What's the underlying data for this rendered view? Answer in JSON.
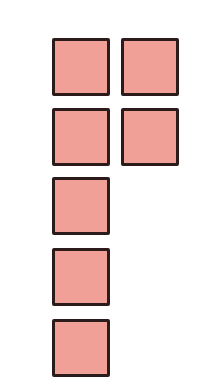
{
  "figure": {
    "fill_color": "#f0a096",
    "border_color": "#2b1b1b",
    "background_color": "#ffffff",
    "square_count": 7,
    "squares": [
      {
        "id": "square-r1-c1",
        "row": 1,
        "col": 1,
        "x": 52,
        "y": 38
      },
      {
        "id": "square-r1-c2",
        "row": 1,
        "col": 2,
        "x": 121,
        "y": 38
      },
      {
        "id": "square-r2-c1",
        "row": 2,
        "col": 1,
        "x": 52,
        "y": 108
      },
      {
        "id": "square-r2-c2",
        "row": 2,
        "col": 2,
        "x": 121,
        "y": 108
      },
      {
        "id": "square-r3-c1",
        "row": 3,
        "col": 1,
        "x": 52,
        "y": 177
      },
      {
        "id": "square-r4-c1",
        "row": 4,
        "col": 1,
        "x": 52,
        "y": 248
      },
      {
        "id": "square-r5-c1",
        "row": 5,
        "col": 1,
        "x": 52,
        "y": 319
      }
    ]
  }
}
